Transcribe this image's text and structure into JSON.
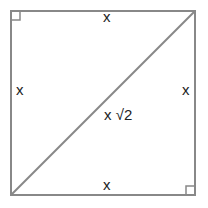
{
  "diagram": {
    "shape": "square",
    "labels": {
      "top": "x",
      "bottom": "x",
      "left": "x",
      "right": "x",
      "diagonal": "x √2"
    },
    "right_angle_markers": [
      "top-left",
      "bottom-right"
    ],
    "colors": {
      "stroke": "#888888",
      "text": "#222222"
    }
  }
}
